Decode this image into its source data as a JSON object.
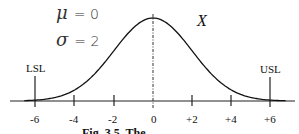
{
  "figure": {
    "parameters": {
      "mu_symbol": "μ",
      "mu_value": "= 0",
      "sigma_symbol": "σ",
      "sigma_value": "= 2"
    },
    "variable_label": "X",
    "spec_limits": {
      "lower": {
        "label": "LSL",
        "value": -6
      },
      "upper": {
        "label": "USL",
        "value": 6
      }
    },
    "axis_ticks": [
      "-6",
      "-4",
      "-2",
      "0",
      "+2",
      "+4",
      "+6"
    ],
    "caption": "Fig. 3.5. The ..."
  },
  "chart_data": {
    "type": "line",
    "title": "",
    "distribution": "normal",
    "mean": 0,
    "std_dev": 2,
    "x": [
      -6,
      -4,
      -2,
      0,
      2,
      4,
      6
    ],
    "series": [
      {
        "name": "X",
        "values": [
          0.0222,
          0.054,
          0.121,
          0.1995,
          0.121,
          0.054,
          0.0222
        ]
      }
    ],
    "xlabel": "",
    "ylabel": "",
    "x_tick_labels": [
      "-6",
      "-4",
      "-2",
      "0",
      "+2",
      "+4",
      "+6"
    ],
    "xlim": [
      -6.5,
      7
    ],
    "annotations": [
      "μ = 0",
      "σ = 2",
      "X",
      "LSL",
      "USL"
    ],
    "vertical_lines": [
      {
        "x": -6,
        "label": "LSL",
        "style": "solid"
      },
      {
        "x": 0,
        "label": "mean",
        "style": "dash-dot"
      },
      {
        "x": 6,
        "label": "USL",
        "style": "solid"
      }
    ],
    "grid": false,
    "legend": "none"
  }
}
